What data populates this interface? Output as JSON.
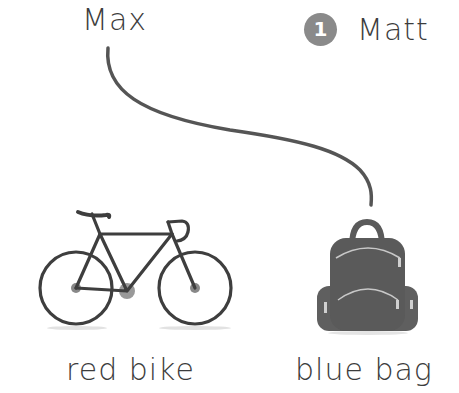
{
  "names": {
    "left": "Max",
    "right": "Matt",
    "right_number": "1"
  },
  "pictures": [
    {
      "caption": "red bike",
      "icon": "bicycle-icon"
    },
    {
      "caption": "blue bag",
      "icon": "backpack-icon"
    }
  ],
  "connector": {
    "from": "Max",
    "to": "blue bag"
  },
  "colors": {
    "text": "#3c3c3c",
    "line": "#555555",
    "badge": "#8a8a8a",
    "bag": "#5a5a5a"
  }
}
